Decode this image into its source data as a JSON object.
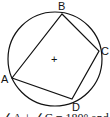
{
  "diagram": {
    "type": "cyclic-quadrilateral",
    "circle": {
      "cx": 55,
      "cy": 59,
      "r": 47
    },
    "center_mark": "+",
    "vertices": [
      {
        "name": "A",
        "x": 12,
        "y": 78,
        "label_x": 1,
        "label_y": 83
      },
      {
        "name": "B",
        "x": 62,
        "y": 14,
        "label_x": 58,
        "label_y": 10
      },
      {
        "name": "C",
        "x": 99,
        "y": 51,
        "label_x": 101,
        "label_y": 55
      },
      {
        "name": "D",
        "x": 72,
        "y": 99,
        "label_x": 72,
        "label_y": 111
      }
    ],
    "caption": "∠A + ∠C = 180° and"
  }
}
